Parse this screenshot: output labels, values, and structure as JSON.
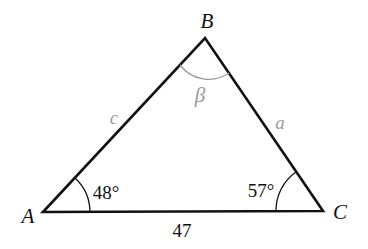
{
  "diagram": {
    "type": "triangle",
    "vertices": {
      "A": {
        "label": "A",
        "x": 43,
        "y": 212
      },
      "B": {
        "label": "B",
        "x": 205,
        "y": 38
      },
      "C": {
        "label": "C",
        "x": 323,
        "y": 211
      }
    },
    "sides": {
      "a": {
        "label": "a",
        "between": [
          "B",
          "C"
        ]
      },
      "c": {
        "label": "c",
        "between": [
          "A",
          "B"
        ]
      },
      "b": {
        "label": "47",
        "between": [
          "A",
          "C"
        ]
      }
    },
    "angles": {
      "A": {
        "label": "48°"
      },
      "B": {
        "label": "β"
      },
      "C": {
        "label": "57°"
      }
    },
    "colors": {
      "lines": "#111111",
      "unknowns": "#9a9a9a",
      "background": "#ffffff"
    }
  }
}
